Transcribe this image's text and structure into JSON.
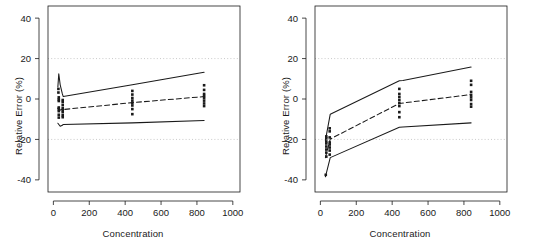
{
  "figure": {
    "width": 533,
    "height": 244,
    "background": "#ffffff",
    "ink_color": "#1a1a1a",
    "grid_color": "#bdbdbd"
  },
  "panels": [
    {
      "id": "left",
      "name": "panel-a"
    },
    {
      "id": "right",
      "name": "panel-b"
    }
  ],
  "axis": {
    "xlabel": "Concentration",
    "ylabel": "Relative Error (%)",
    "xticks": [
      0,
      200,
      400,
      600,
      800,
      1000
    ],
    "xtick_labels": [
      "0",
      "200",
      "400",
      "600",
      "800",
      "1000"
    ],
    "yticks": [
      -40,
      -20,
      0,
      20,
      40
    ],
    "ytick_labels": [
      "-40",
      "-20",
      "0",
      "20",
      "40"
    ],
    "xlim": [
      -30,
      1040
    ],
    "ylim": [
      -46,
      46
    ],
    "gridlines_y": [
      20,
      -20
    ],
    "grid_style": "dotted"
  },
  "chart_data": [
    {
      "type": "scatter",
      "panel": "left",
      "title": "",
      "xlabel": "Concentration",
      "ylabel": "Relative Error (%)",
      "xlim": [
        -30,
        1040
      ],
      "ylim": [
        -46,
        46
      ],
      "grid": "dotted horizontal at +20 and -20",
      "legend": "none",
      "series": [
        {
          "name": "upper tolerance limit",
          "style": "solid",
          "x": [
            25,
            30,
            38,
            50,
            55,
            440,
            840
          ],
          "y": [
            6.0,
            12.5,
            7.0,
            2.5,
            1.2,
            7.0,
            13.2
          ]
        },
        {
          "name": "mean relative error",
          "style": "dashed",
          "x": [
            25,
            38,
            50,
            55,
            440,
            840
          ],
          "y": [
            -4.5,
            -5.5,
            -5.0,
            -5.2,
            -1.8,
            1.2
          ]
        },
        {
          "name": "lower tolerance limit",
          "style": "solid",
          "x": [
            25,
            38,
            50,
            55,
            440,
            840
          ],
          "y": [
            -12.0,
            -13.5,
            -13.0,
            -12.6,
            -11.8,
            -10.6
          ]
        }
      ],
      "points": [
        {
          "x": 28,
          "y": 5.0
        },
        {
          "x": 28,
          "y": 3.2
        },
        {
          "x": 30,
          "y": 0.8
        },
        {
          "x": 30,
          "y": -0.2
        },
        {
          "x": 30,
          "y": -1.0
        },
        {
          "x": 30,
          "y": -4.2
        },
        {
          "x": 30,
          "y": -5.0
        },
        {
          "x": 30,
          "y": -6.0
        },
        {
          "x": 30,
          "y": -7.8
        },
        {
          "x": 30,
          "y": -9.2
        },
        {
          "x": 52,
          "y": -0.5
        },
        {
          "x": 52,
          "y": -1.5
        },
        {
          "x": 52,
          "y": -3.0
        },
        {
          "x": 52,
          "y": -4.5
        },
        {
          "x": 52,
          "y": -5.5
        },
        {
          "x": 52,
          "y": -6.5
        },
        {
          "x": 52,
          "y": -8.0
        },
        {
          "x": 52,
          "y": -9.0
        },
        {
          "x": 440,
          "y": 4.0
        },
        {
          "x": 440,
          "y": 2.2
        },
        {
          "x": 440,
          "y": 0.5
        },
        {
          "x": 440,
          "y": -0.8
        },
        {
          "x": 440,
          "y": -2.0
        },
        {
          "x": 440,
          "y": -3.2
        },
        {
          "x": 440,
          "y": -5.0
        },
        {
          "x": 440,
          "y": -7.5
        },
        {
          "x": 840,
          "y": 6.8
        },
        {
          "x": 840,
          "y": 4.5
        },
        {
          "x": 840,
          "y": 2.5
        },
        {
          "x": 840,
          "y": 1.5
        },
        {
          "x": 840,
          "y": 0.5
        },
        {
          "x": 840,
          "y": -0.8
        },
        {
          "x": 840,
          "y": -2.2
        },
        {
          "x": 840,
          "y": -3.5
        }
      ]
    },
    {
      "type": "scatter",
      "panel": "right",
      "title": "",
      "xlabel": "Concentration",
      "ylabel": "Relative Error (%)",
      "xlim": [
        -30,
        1040
      ],
      "ylim": [
        -46,
        46
      ],
      "grid": "dotted horizontal at +20 and -20",
      "legend": "none",
      "series": [
        {
          "name": "upper tolerance limit",
          "style": "solid",
          "x": [
            28,
            55,
            440,
            460,
            840
          ],
          "y": [
            -20.5,
            -7.5,
            9.0,
            9.2,
            15.8
          ]
        },
        {
          "name": "mean relative error",
          "style": "dashed",
          "x": [
            28,
            55,
            440,
            840
          ],
          "y": [
            -29.0,
            -19.8,
            -2.2,
            2.2
          ]
        },
        {
          "name": "lower tolerance limit",
          "style": "solid",
          "x": [
            28,
            55,
            440,
            460,
            840
          ],
          "y": [
            -38.5,
            -29.0,
            -14.0,
            -13.8,
            -11.8
          ]
        }
      ],
      "points": [
        {
          "x": 30,
          "y": -37.5
        },
        {
          "x": 33,
          "y": -28.5
        },
        {
          "x": 33,
          "y": -26.5
        },
        {
          "x": 33,
          "y": -25.0
        },
        {
          "x": 33,
          "y": -23.5
        },
        {
          "x": 33,
          "y": -22.0
        },
        {
          "x": 33,
          "y": -21.0
        },
        {
          "x": 33,
          "y": -19.5
        },
        {
          "x": 33,
          "y": -18.5
        },
        {
          "x": 52,
          "y": -27.5
        },
        {
          "x": 52,
          "y": -25.5
        },
        {
          "x": 52,
          "y": -24.0
        },
        {
          "x": 52,
          "y": -22.5
        },
        {
          "x": 52,
          "y": -21.5
        },
        {
          "x": 52,
          "y": -19.0
        },
        {
          "x": 52,
          "y": -16.0
        },
        {
          "x": 52,
          "y": -14.5
        },
        {
          "x": 440,
          "y": 5.0
        },
        {
          "x": 440,
          "y": 2.5
        },
        {
          "x": 440,
          "y": 1.0
        },
        {
          "x": 440,
          "y": -0.5
        },
        {
          "x": 440,
          "y": -2.0
        },
        {
          "x": 440,
          "y": -3.5
        },
        {
          "x": 440,
          "y": -6.5
        },
        {
          "x": 440,
          "y": -9.0
        },
        {
          "x": 840,
          "y": 9.0
        },
        {
          "x": 840,
          "y": 7.0
        },
        {
          "x": 840,
          "y": 3.5
        },
        {
          "x": 840,
          "y": 2.0
        },
        {
          "x": 840,
          "y": 0.8
        },
        {
          "x": 840,
          "y": -0.5
        },
        {
          "x": 840,
          "y": -2.5
        },
        {
          "x": 840,
          "y": -3.8
        }
      ]
    }
  ]
}
